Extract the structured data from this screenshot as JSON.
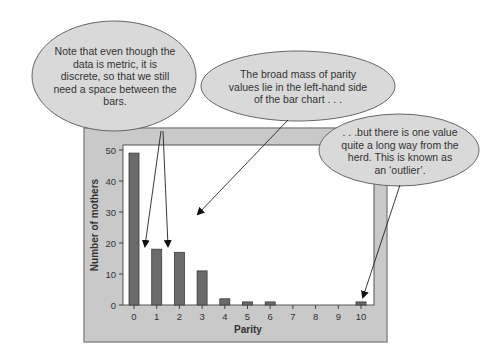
{
  "chart_data": {
    "type": "bar",
    "title": "",
    "xlabel": "Parity",
    "ylabel": "Number of mothers",
    "categories": [
      "0",
      "1",
      "2",
      "3",
      "4",
      "5",
      "6",
      "7",
      "8",
      "9",
      "10"
    ],
    "values": [
      49,
      18,
      17,
      11,
      2,
      1,
      1,
      0,
      0,
      0,
      1
    ],
    "ylim": [
      0,
      50
    ],
    "yticks": [
      "0",
      "10",
      "20",
      "30",
      "40",
      "50"
    ],
    "grid": false,
    "legend": null
  },
  "colors": {
    "bar": "#6b6b6b",
    "frame": "#c9c9c9",
    "plot_bg": "#ffffff",
    "callout": "#d9d9d9"
  },
  "callouts": [
    {
      "text": "Note that even though the data is metric, it is discrete, so that we still need a space between the bars."
    },
    {
      "text": "The broad mass of parity values lie in the left-hand side of the bar chart . . ."
    },
    {
      "text": ". . .but there is one value quite a long way from the herd. This is known as an ‘outlier’."
    }
  ]
}
